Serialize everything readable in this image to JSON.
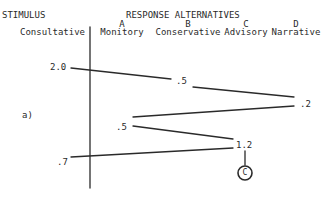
{
  "header": {
    "stimulus_label": "STIMULUS",
    "response_label": "RESPONSE ALTERNATIVES",
    "stimulus_name": "Consultative"
  },
  "alternatives": [
    {
      "letter": "A",
      "name": "Monitory"
    },
    {
      "letter": "B",
      "name": "Conservative"
    },
    {
      "letter": "C",
      "name": "Advisory"
    },
    {
      "letter": "D",
      "name": "Narrative"
    }
  ],
  "panel_label": "a)",
  "path_values": [
    "2.0",
    ".5",
    ".2",
    ".5",
    "1.2",
    ".7"
  ],
  "terminal": {
    "label": "C"
  },
  "colors": {
    "ink": "#2a2a2a",
    "background": "#ffffff"
  }
}
